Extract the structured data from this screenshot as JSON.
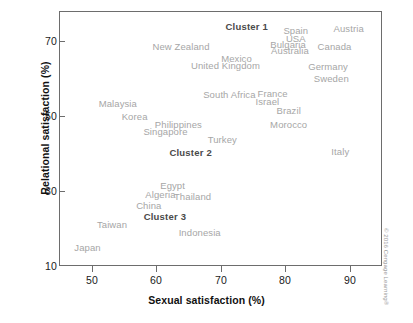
{
  "figure": {
    "credit": "© 2016 Cengage Learning®"
  },
  "chart_data": {
    "type": "scatter",
    "title": "",
    "xlabel": "Sexual satisfaction (%)",
    "ylabel": "Relational satisfaction (%)",
    "xlim": [
      45,
      95
    ],
    "ylim": [
      10,
      78
    ],
    "xticks": [
      50,
      60,
      70,
      80,
      90
    ],
    "yticks": [
      10,
      30,
      50,
      70
    ],
    "xtick_labels": [
      "50",
      "60",
      "70",
      "80",
      "90"
    ],
    "ytick_labels": [
      "10",
      "30",
      "50",
      "70"
    ],
    "grid": false,
    "legend": "none",
    "marker_style": "text-label-only",
    "points": [
      {
        "label": "Spain",
        "x": 81.6,
        "y": 73.0
      },
      {
        "label": "Austria",
        "x": 89.8,
        "y": 73.6
      },
      {
        "label": "USA",
        "x": 81.6,
        "y": 70.9
      },
      {
        "label": "Bulgaria",
        "x": 80.4,
        "y": 69.1
      },
      {
        "label": "Canada",
        "x": 87.6,
        "y": 68.8
      },
      {
        "label": "Australia",
        "x": 80.7,
        "y": 67.5
      },
      {
        "label": "New Zealand",
        "x": 63.8,
        "y": 68.8
      },
      {
        "label": "Mexico",
        "x": 72.4,
        "y": 65.4
      },
      {
        "label": "United Kingdom",
        "x": 70.7,
        "y": 63.6
      },
      {
        "label": "Germany",
        "x": 86.6,
        "y": 63.3
      },
      {
        "label": "Sweden",
        "x": 87.1,
        "y": 60.2
      },
      {
        "label": "South Africa",
        "x": 71.3,
        "y": 55.9
      },
      {
        "label": "France",
        "x": 78.0,
        "y": 56.2
      },
      {
        "label": "Israel",
        "x": 77.2,
        "y": 54.1
      },
      {
        "label": "Malaysia",
        "x": 54.0,
        "y": 53.6
      },
      {
        "label": "Brazil",
        "x": 80.5,
        "y": 51.5
      },
      {
        "label": "Korea",
        "x": 56.6,
        "y": 50.0
      },
      {
        "label": "Philippines",
        "x": 63.4,
        "y": 47.8
      },
      {
        "label": "Morocco",
        "x": 80.5,
        "y": 47.8
      },
      {
        "label": "Singapore",
        "x": 61.4,
        "y": 46.0
      },
      {
        "label": "Turkey",
        "x": 70.2,
        "y": 43.8
      },
      {
        "label": "Italy",
        "x": 88.5,
        "y": 40.8
      },
      {
        "label": "Egypt",
        "x": 62.5,
        "y": 31.5
      },
      {
        "label": "Algeria",
        "x": 60.6,
        "y": 29.1
      },
      {
        "label": "Thailand",
        "x": 65.6,
        "y": 28.8
      },
      {
        "label": "China",
        "x": 58.8,
        "y": 26.4
      },
      {
        "label": "Taiwan",
        "x": 53.1,
        "y": 21.2
      },
      {
        "label": "Indonesia",
        "x": 66.7,
        "y": 19.1
      },
      {
        "label": "Japan",
        "x": 49.3,
        "y": 15.2
      }
    ],
    "clusters": [
      {
        "label": "Cluster 1",
        "x": 74.0,
        "y": 74.0
      },
      {
        "label": "Cluster 2",
        "x": 65.3,
        "y": 40.5
      },
      {
        "label": "Cluster 3",
        "x": 61.3,
        "y": 23.3
      }
    ]
  }
}
